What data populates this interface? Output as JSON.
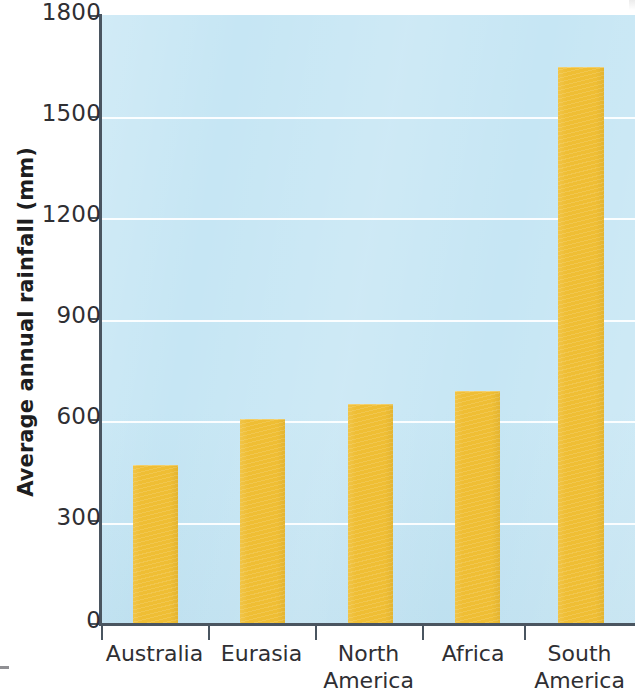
{
  "chart_data": {
    "type": "bar",
    "title": "",
    "subtitle": "",
    "xlabel": "",
    "ylabel": "Average annual rainfall (mm)",
    "categories": [
      "Australia",
      "Eurasia",
      "North\nAmerica",
      "Africa",
      "South\nAmerica"
    ],
    "values": [
      470,
      605,
      650,
      690,
      1645
    ],
    "ylim": [
      0,
      1800
    ],
    "yticks": [
      0,
      300,
      600,
      900,
      1200,
      1500,
      1800
    ],
    "ytick_labels": [
      "0",
      "300",
      "600",
      "900",
      "1200",
      "1500",
      "1800"
    ],
    "grid": true,
    "grid_axis": "y",
    "legend": false,
    "legend_position": "none",
    "series": [
      {
        "name": "Average annual rainfall",
        "values": [
          470,
          605,
          650,
          690,
          1645
        ]
      }
    ]
  },
  "style": {
    "bar_color": "#efbe34",
    "plot_background": "#c6e6f4",
    "gridline_color": "#ffffff",
    "axis_color": "#4a5560",
    "text_color": "#2f2f33",
    "page_background": "#ffffff"
  },
  "axes": {
    "y_title": "Average annual rainfall (mm)",
    "y_tick_0": "0",
    "y_tick_300": "300",
    "y_tick_600": "600",
    "y_tick_900": "900",
    "y_tick_1200": "1200",
    "y_tick_1500": "1500",
    "y_tick_1800": "1800"
  },
  "x_labels": {
    "c0": "Australia",
    "c1": "Eurasia",
    "c2": "North\nAmerica",
    "c3": "Africa",
    "c4": "South\nAmerica"
  }
}
